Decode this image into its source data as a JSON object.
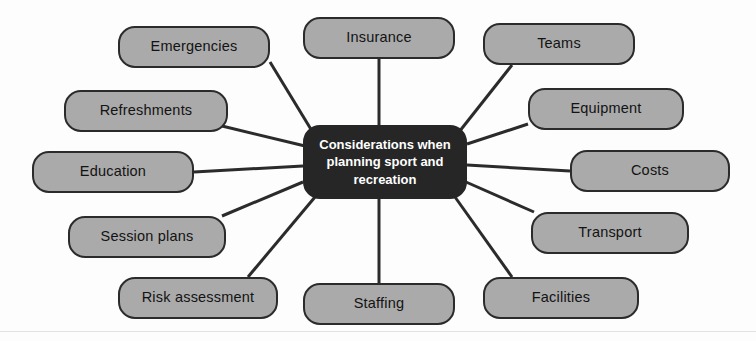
{
  "diagram": {
    "type": "mind-map",
    "title": "Considerations when planning sport and recreation",
    "center": {
      "label": "Considerations when planning sport and recreation",
      "x": 303,
      "y": 125,
      "width": 164,
      "height": 74,
      "fill": "#262626",
      "text_color": "#ffffff"
    },
    "style": {
      "node_fill": "#aaaaaa",
      "node_border": "#2b2b2b",
      "node_text": "#131313",
      "edge_color": "#2b2b2b",
      "background": "#fdfdfd"
    },
    "nodes": [
      {
        "id": "emergencies",
        "label": "Emergencies",
        "x": 118,
        "y": 26,
        "width": 152,
        "height": 42,
        "anchor_x": 270,
        "anchor_y": 62,
        "center_x": 312,
        "center_y": 131
      },
      {
        "id": "insurance",
        "label": "Insurance",
        "x": 303,
        "y": 17,
        "width": 152,
        "height": 42,
        "anchor_x": 379,
        "anchor_y": 59,
        "center_x": 379,
        "center_y": 125
      },
      {
        "id": "teams",
        "label": "Teams",
        "x": 483,
        "y": 23,
        "width": 152,
        "height": 42,
        "anchor_x": 512,
        "anchor_y": 65,
        "center_x": 459,
        "center_y": 132
      },
      {
        "id": "equipment",
        "label": "Equipment",
        "x": 528,
        "y": 88,
        "width": 156,
        "height": 42,
        "anchor_x": 528,
        "anchor_y": 124,
        "center_x": 467,
        "center_y": 144
      },
      {
        "id": "costs",
        "label": "Costs",
        "x": 570,
        "y": 150,
        "width": 160,
        "height": 42,
        "anchor_x": 570,
        "anchor_y": 171,
        "center_x": 467,
        "center_y": 165
      },
      {
        "id": "transport",
        "label": "Transport",
        "x": 531,
        "y": 212,
        "width": 158,
        "height": 42,
        "anchor_x": 534,
        "anchor_y": 212,
        "center_x": 466,
        "center_y": 182
      },
      {
        "id": "facilities",
        "label": "Facilities",
        "x": 483,
        "y": 277,
        "width": 156,
        "height": 42,
        "anchor_x": 512,
        "anchor_y": 277,
        "center_x": 455,
        "center_y": 197
      },
      {
        "id": "staffing",
        "label": "Staffing",
        "x": 303,
        "y": 283,
        "width": 152,
        "height": 42,
        "anchor_x": 379,
        "anchor_y": 283,
        "center_x": 379,
        "center_y": 199
      },
      {
        "id": "risk-assessment",
        "label": "Risk assessment",
        "x": 118,
        "y": 277,
        "width": 160,
        "height": 42,
        "anchor_x": 248,
        "anchor_y": 277,
        "center_x": 315,
        "center_y": 197
      },
      {
        "id": "session-plans",
        "label": "Session plans",
        "x": 68,
        "y": 216,
        "width": 158,
        "height": 42,
        "anchor_x": 222,
        "anchor_y": 216,
        "center_x": 303,
        "center_y": 182
      },
      {
        "id": "education",
        "label": "Education",
        "x": 32,
        "y": 151,
        "width": 162,
        "height": 42,
        "anchor_x": 194,
        "anchor_y": 172,
        "center_x": 303,
        "center_y": 166
      },
      {
        "id": "refreshments",
        "label": "Refreshments",
        "x": 64,
        "y": 90,
        "width": 164,
        "height": 42,
        "anchor_x": 222,
        "anchor_y": 126,
        "center_x": 305,
        "center_y": 146
      }
    ],
    "page_edge_y": 331
  }
}
